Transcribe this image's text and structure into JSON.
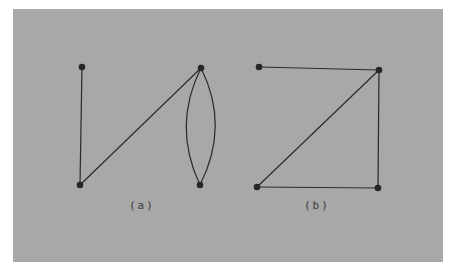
{
  "figure": {
    "background_color": "#a8a8a6",
    "edge_color": "#2a2a2a",
    "node_color": "#262626",
    "graphs": [
      {
        "id": "a",
        "caption": "(a)",
        "nodes": [
          {
            "id": "a1",
            "x": 82,
            "y": 67
          },
          {
            "id": "a2",
            "x": 80,
            "y": 185
          },
          {
            "id": "a3",
            "x": 201,
            "y": 68
          },
          {
            "id": "a4",
            "x": 200,
            "y": 185
          }
        ],
        "edges": [
          {
            "from": "a1",
            "to": "a2",
            "type": "straight"
          },
          {
            "from": "a2",
            "to": "a3",
            "type": "straight"
          },
          {
            "from": "a3",
            "to": "a4",
            "type": "curved-left"
          },
          {
            "from": "a3",
            "to": "a4",
            "type": "curved-right"
          }
        ]
      },
      {
        "id": "b",
        "caption": "(b)",
        "nodes": [
          {
            "id": "b1",
            "x": 259,
            "y": 67
          },
          {
            "id": "b2",
            "x": 379,
            "y": 70
          },
          {
            "id": "b3",
            "x": 257,
            "y": 187
          },
          {
            "id": "b4",
            "x": 378,
            "y": 188
          }
        ],
        "edges": [
          {
            "from": "b1",
            "to": "b2",
            "type": "straight"
          },
          {
            "from": "b2",
            "to": "b3",
            "type": "straight"
          },
          {
            "from": "b2",
            "to": "b4",
            "type": "straight"
          },
          {
            "from": "b3",
            "to": "b4",
            "type": "straight"
          }
        ]
      }
    ]
  }
}
